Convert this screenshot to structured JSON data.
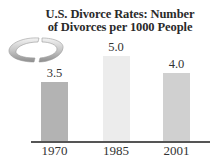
{
  "chart_data": {
    "type": "bar",
    "title": "U.S. Divorce Rates: Number of Divorces per 1000 People",
    "title_lines": [
      "U.S. Divorce Rates: Number",
      "of Divorces per 1000 People"
    ],
    "categories": [
      "1970",
      "1985",
      "2001"
    ],
    "values": [
      3.5,
      5.0,
      4.0
    ],
    "value_labels": [
      "3.5",
      "5.0",
      "4.0"
    ],
    "bar_colors": [
      "#b3b3b3",
      "#ececec",
      "#d0d0d0"
    ],
    "xlabel": "",
    "ylabel": "",
    "ylim": [
      0,
      5.5
    ],
    "grid": false,
    "legend": null,
    "decoration": "broken-ring-icon"
  }
}
